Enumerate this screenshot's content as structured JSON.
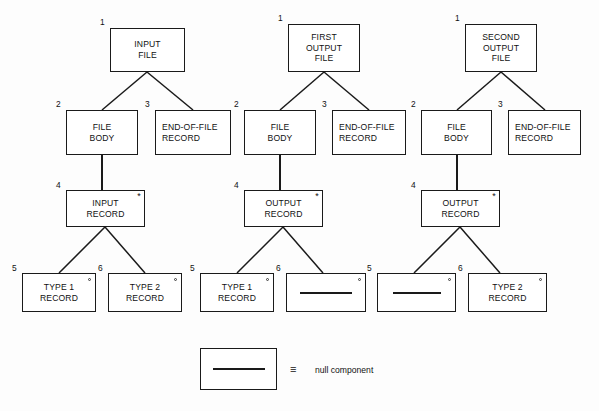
{
  "diagram": {
    "columns": [
      {
        "id": "input-file",
        "nodes": [
          {
            "num": "1",
            "lines": [
              "INPUT",
              "FILE"
            ],
            "marker": "none",
            "kind": "box"
          },
          {
            "num": "2",
            "lines": [
              "FILE",
              "BODY"
            ],
            "marker": "none",
            "kind": "box"
          },
          {
            "num": "3",
            "lines": [
              "END-OF-FILE",
              "RECORD"
            ],
            "marker": "none",
            "kind": "box"
          },
          {
            "num": "4",
            "lines": [
              "INPUT",
              "RECORD"
            ],
            "marker": "asterisk",
            "kind": "box"
          },
          {
            "num": "5",
            "lines": [
              "TYPE 1",
              "RECORD"
            ],
            "marker": "circle",
            "kind": "box"
          },
          {
            "num": "6",
            "lines": [
              "TYPE 2",
              "RECORD"
            ],
            "marker": "circle",
            "kind": "box"
          }
        ]
      },
      {
        "id": "first-output-file",
        "nodes": [
          {
            "num": "1",
            "lines": [
              "FIRST",
              "OUTPUT",
              "FILE"
            ],
            "marker": "none",
            "kind": "box"
          },
          {
            "num": "2",
            "lines": [
              "FILE",
              "BODY"
            ],
            "marker": "none",
            "kind": "box"
          },
          {
            "num": "3",
            "lines": [
              "END-OF-FILE",
              "RECORD"
            ],
            "marker": "none",
            "kind": "box"
          },
          {
            "num": "4",
            "lines": [
              "OUTPUT",
              "RECORD"
            ],
            "marker": "asterisk",
            "kind": "box"
          },
          {
            "num": "5",
            "lines": [
              "TYPE 1",
              "RECORD"
            ],
            "marker": "circle",
            "kind": "box"
          },
          {
            "num": "6",
            "lines": [],
            "marker": "circle",
            "kind": "null"
          }
        ]
      },
      {
        "id": "second-output-file",
        "nodes": [
          {
            "num": "1",
            "lines": [
              "SECOND",
              "OUTPUT",
              "FILE"
            ],
            "marker": "none",
            "kind": "box"
          },
          {
            "num": "2",
            "lines": [
              "FILE",
              "BODY"
            ],
            "marker": "none",
            "kind": "box"
          },
          {
            "num": "3",
            "lines": [
              "END-OF-FILE",
              "RECORD"
            ],
            "marker": "none",
            "kind": "box"
          },
          {
            "num": "4",
            "lines": [
              "OUTPUT",
              "RECORD"
            ],
            "marker": "asterisk",
            "kind": "box"
          },
          {
            "num": "5",
            "lines": [],
            "marker": "circle",
            "kind": "null"
          },
          {
            "num": "6",
            "lines": [
              "TYPE 2",
              "RECORD"
            ],
            "marker": "circle",
            "kind": "box"
          }
        ]
      }
    ]
  },
  "nodes": {
    "c1n1l1": "INPUT",
    "c1n1l2": "FILE",
    "c1n2l1": "FILE",
    "c1n2l2": "BODY",
    "c1n3l1": "END-OF-FILE",
    "c1n3l2": "RECORD",
    "c1n4l1": "INPUT",
    "c1n4l2": "RECORD",
    "c1n5l1": "TYPE 1",
    "c1n5l2": "RECORD",
    "c1n6l1": "TYPE 2",
    "c1n6l2": "RECORD",
    "c2n1l1": "FIRST",
    "c2n1l2": "OUTPUT",
    "c2n1l3": "FILE",
    "c2n2l1": "FILE",
    "c2n2l2": "BODY",
    "c2n3l1": "END-OF-FILE",
    "c2n3l2": "RECORD",
    "c2n4l1": "OUTPUT",
    "c2n4l2": "RECORD",
    "c2n5l1": "TYPE 1",
    "c2n5l2": "RECORD",
    "c3n1l1": "SECOND",
    "c3n1l2": "OUTPUT",
    "c3n1l3": "FILE",
    "c3n2l1": "FILE",
    "c3n2l2": "BODY",
    "c3n3l1": "END-OF-FILE",
    "c3n3l2": "RECORD",
    "c3n4l1": "OUTPUT",
    "c3n4l2": "RECORD",
    "c3n6l1": "TYPE 2",
    "c3n6l2": "RECORD"
  },
  "numbers": {
    "c1n1": "1",
    "c1n2": "2",
    "c1n3": "3",
    "c1n4": "4",
    "c1n5": "5",
    "c1n6": "6",
    "c2n1": "1",
    "c2n2": "2",
    "c2n3": "3",
    "c2n4": "4",
    "c2n5": "5",
    "c2n6": "6",
    "c3n1": "1",
    "c3n2": "2",
    "c3n3": "3",
    "c3n4": "4",
    "c3n5": "5",
    "c3n6": "6"
  },
  "markers": {
    "iteration": "*",
    "selection": "o"
  },
  "legend": {
    "equivalence_symbol": "≡",
    "text": "null component"
  },
  "colors": {
    "line": "#1a1a1a",
    "text": "#111111",
    "background": "#fdfdfd"
  }
}
